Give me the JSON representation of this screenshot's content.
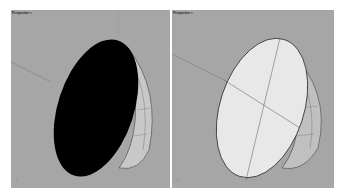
{
  "viewports": [
    {
      "title": "Perspective ▾",
      "display_mode": "shaded-dark",
      "object": "hemisphere",
      "face_color": "#000000",
      "background": "#a6a6a6"
    },
    {
      "title": "Perspective ▾",
      "display_mode": "shaded-light",
      "object": "hemisphere",
      "face_color": "#e6e6e6",
      "background": "#a6a6a6"
    }
  ],
  "icons": {
    "axis": "world-axis-icon"
  }
}
